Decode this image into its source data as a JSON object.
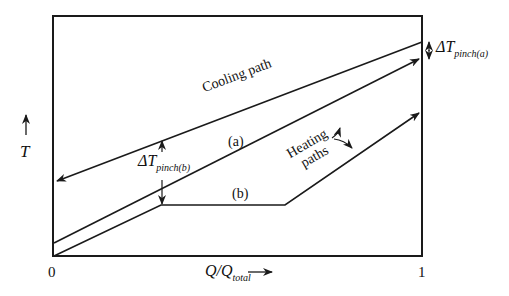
{
  "diagram": {
    "type": "temperature-enthalpy composite curves",
    "y_axis_label": "T",
    "x_axis_label_main": "Q/Q",
    "x_axis_label_sub": "total",
    "x_origin_tick": "0",
    "x_end_tick": "1",
    "labels": {
      "cooling_path": "Cooling path",
      "heating_a": "(a)",
      "heating_b": "(b)",
      "heating_paths": "Heating paths",
      "heating_paths_line1": "Heating",
      "heating_paths_line2": "paths",
      "delta_t_pinch_a_main": "ΔT",
      "delta_t_pinch_a_sub": "pinch(a)",
      "delta_t_pinch_b_main": "ΔT",
      "delta_t_pinch_b_sub": "pinch(b)"
    },
    "line_color": "#1a1a1a",
    "background": "#ffffff"
  }
}
